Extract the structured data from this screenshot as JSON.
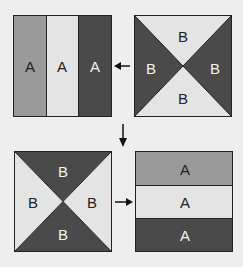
{
  "colors": {
    "background": "#eeeeee",
    "medium": "#9a9a9a",
    "light": "#e4e4e4",
    "dark": "#4a4a4a",
    "border": "#222222",
    "text_dark": "#222222",
    "text_light": "#f2f2f2"
  },
  "panels": {
    "top_left": {
      "type": "vertical-stripes",
      "labels": [
        "A",
        "A",
        "A"
      ],
      "fills": [
        "medium",
        "light",
        "dark"
      ]
    },
    "top_right": {
      "type": "hourglass-x",
      "labels": {
        "top": "B",
        "left": "B",
        "right": "B",
        "bottom": "B"
      },
      "fills": {
        "top": "light",
        "left": "dark",
        "right": "dark",
        "bottom": "light"
      }
    },
    "bottom_left": {
      "type": "hourglass-x",
      "labels": {
        "top": "B",
        "left": "B",
        "right": "B",
        "bottom": "B"
      },
      "fills": {
        "top": "dark",
        "left": "light",
        "right": "light",
        "bottom": "dark"
      }
    },
    "bottom_right": {
      "type": "horizontal-stripes",
      "labels": [
        "A",
        "A",
        "A"
      ],
      "fills": [
        "medium",
        "light",
        "dark"
      ]
    }
  },
  "arrows": [
    {
      "id": "right-to-left-top",
      "direction": "left"
    },
    {
      "id": "top-to-bottom",
      "direction": "down"
    },
    {
      "id": "left-to-right-bottom",
      "direction": "right"
    }
  ]
}
